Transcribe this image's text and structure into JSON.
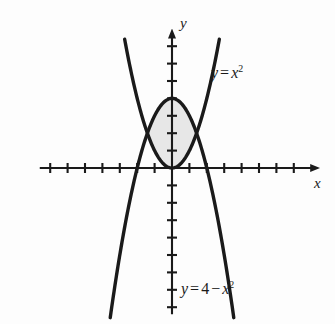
{
  "figure": {
    "name": "region-between-parabolas",
    "background_color": "#fdfdfd",
    "ink_color": "#1a1a1a",
    "shade_color": "#e7e7e7"
  },
  "labels": {
    "axis_x": "x",
    "axis_y": "y",
    "curve_upper_y": "y",
    "curve_upper_eq": "=",
    "curve_upper_var": "x",
    "curve_upper_exp": "2",
    "curve_upper_full": "y = x²",
    "curve_lower_y": "y",
    "curve_lower_eq": "=",
    "curve_lower_const": "4",
    "curve_lower_minus": "−",
    "curve_lower_var": "x",
    "curve_lower_exp": "2",
    "curve_lower_full": "y = 4 − x²"
  },
  "chart_data": {
    "type": "line",
    "title": "",
    "xlabel": "x",
    "ylabel": "y",
    "xlim": [
      -7.8,
      8.0
    ],
    "ylim": [
      -8.5,
      7.6
    ],
    "grid": false,
    "legend": "none",
    "axes": {
      "origin_px": [
        172,
        168
      ],
      "unit_px": 17.4,
      "x_axis_from": -7.6,
      "x_axis_to": 8.0,
      "y_axis_from": -8.4,
      "y_axis_to": 7.5,
      "x_ticks": [
        -7,
        -6,
        -5,
        -4,
        -3,
        -2,
        -1,
        1,
        2,
        3,
        4,
        5,
        6,
        7
      ],
      "y_ticks": [
        -8,
        -7,
        -6,
        -5,
        -4,
        -3,
        -2,
        -1,
        1,
        2,
        3,
        4,
        5,
        6,
        7
      ],
      "tick_half_len_px": 5,
      "arrow_x": true,
      "arrow_y": true
    },
    "series": [
      {
        "name": "y = x^2",
        "kind": "parabola",
        "a": 1,
        "c": 0,
        "x_from": -2.72,
        "x_to": 2.72,
        "stroke": "#1a1a1a",
        "stroke_width_px": 3.4,
        "label": "y = x²",
        "label_at": [
          3.0,
          5.2
        ]
      },
      {
        "name": "y = 4 - x^2",
        "kind": "parabola",
        "a": -1,
        "c": 4,
        "x_from": -3.55,
        "x_to": 3.55,
        "stroke": "#1a1a1a",
        "stroke_width_px": 3.4,
        "label": "y = 4 − x²",
        "label_at": [
          1.0,
          -7.2
        ]
      }
    ],
    "shaded_region": {
      "name": "area-between-curves",
      "upper_curve": "y = 4 - x^2",
      "lower_curve": "y = x^2",
      "x_from": -1.414,
      "x_to": 1.414,
      "fill": "#e7e7e7",
      "intersections": [
        {
          "x": -1.414,
          "y": 2
        },
        {
          "x": 1.414,
          "y": 2
        }
      ],
      "top_vertex": {
        "x": 0,
        "y": 4
      },
      "bottom_vertex": {
        "x": 0,
        "y": 0
      }
    }
  }
}
